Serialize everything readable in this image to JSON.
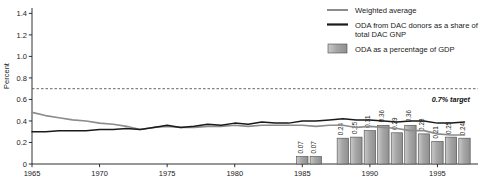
{
  "chart_data": {
    "type": "line",
    "title": "",
    "xlabel": "",
    "ylabel": "Percent",
    "xlim": [
      1965,
      1998
    ],
    "ylim": [
      0,
      1.45
    ],
    "grid": false,
    "legend_position": "top-right",
    "y_ticks": [
      "0",
      "0.2",
      "0.4",
      "0.6",
      "0.8",
      "1.0",
      "1.2",
      "1.4"
    ],
    "y_tick_values": [
      0,
      0.2,
      0.4,
      0.6,
      0.8,
      1.0,
      1.2,
      1.4
    ],
    "x_ticks": [
      "1965",
      "1970",
      "1975",
      "1980",
      "1985",
      "1990",
      "1995"
    ],
    "x_tick_values": [
      1965,
      1970,
      1975,
      1980,
      1985,
      1990,
      1995
    ],
    "annotations": [
      {
        "text": "0.7% target",
        "value": 0.7,
        "style": "dashed-horizontal-line"
      }
    ],
    "series": [
      {
        "name": "Weighted average",
        "type": "line",
        "color": "#8c8c8c",
        "x": [
          1965,
          1966,
          1967,
          1968,
          1969,
          1970,
          1971,
          1972,
          1973,
          1974,
          1975,
          1976,
          1977,
          1978,
          1979,
          1980,
          1981,
          1982,
          1983,
          1984,
          1985,
          1986,
          1987,
          1988,
          1989,
          1990,
          1991,
          1992,
          1993,
          1994,
          1995,
          1996,
          1997
        ],
        "values": [
          0.48,
          0.45,
          0.43,
          0.41,
          0.4,
          0.38,
          0.37,
          0.35,
          0.32,
          0.34,
          0.35,
          0.34,
          0.34,
          0.35,
          0.35,
          0.36,
          0.35,
          0.36,
          0.36,
          0.36,
          0.36,
          0.35,
          0.36,
          0.36,
          0.34,
          0.35,
          0.34,
          0.33,
          0.31,
          0.31,
          0.28,
          0.27,
          0.27
        ]
      },
      {
        "name": "ODA from DAC donors as a share of total DAC GNP",
        "type": "line",
        "color": "#1a1a1a",
        "x": [
          1965,
          1966,
          1967,
          1968,
          1969,
          1970,
          1971,
          1972,
          1973,
          1974,
          1975,
          1976,
          1977,
          1978,
          1979,
          1980,
          1981,
          1982,
          1983,
          1984,
          1985,
          1986,
          1987,
          1988,
          1989,
          1990,
          1991,
          1992,
          1993,
          1994,
          1995,
          1996,
          1997
        ],
        "values": [
          0.3,
          0.3,
          0.31,
          0.31,
          0.31,
          0.32,
          0.32,
          0.33,
          0.32,
          0.34,
          0.36,
          0.34,
          0.35,
          0.37,
          0.36,
          0.38,
          0.37,
          0.39,
          0.38,
          0.38,
          0.4,
          0.4,
          0.41,
          0.42,
          0.41,
          0.41,
          0.4,
          0.39,
          0.4,
          0.4,
          0.38,
          0.38,
          0.39
        ]
      },
      {
        "name": "ODA as a percentage of GDP",
        "type": "bar",
        "color": "#9e9e9e",
        "x": [
          1985,
          1986,
          1988,
          1989,
          1990,
          1991,
          1992,
          1993,
          1994,
          1995,
          1996,
          1997
        ],
        "values": [
          0.07,
          0.07,
          0.24,
          0.25,
          0.31,
          0.36,
          0.29,
          0.36,
          0.28,
          0.21,
          0.25,
          0.24
        ],
        "labels": [
          "0.07",
          "0.07",
          "0.24",
          "0.25",
          "0.31",
          "0.36",
          "0.29",
          "0.36",
          "0.28",
          "0.21",
          "0.25",
          "0.24"
        ]
      }
    ]
  },
  "legend": {
    "items": [
      {
        "label": "Weighted average",
        "marker": "line",
        "color": "#8c8c8c"
      },
      {
        "label": "ODA from DAC donors as a share of",
        "label2": "total DAC GNP",
        "marker": "line",
        "color": "#1a1a1a"
      },
      {
        "label": "ODA as a percentage of GDP",
        "marker": "swatch",
        "color": "#9e9e9e"
      }
    ]
  },
  "axis": {
    "y_title": "Percent"
  },
  "target": {
    "label": "0.7% target"
  },
  "colors": {
    "weighted_average": "#8c8c8c",
    "dac_share": "#1a1a1a",
    "bars": "#9e9e9e",
    "axis": "#1a1a1a"
  }
}
